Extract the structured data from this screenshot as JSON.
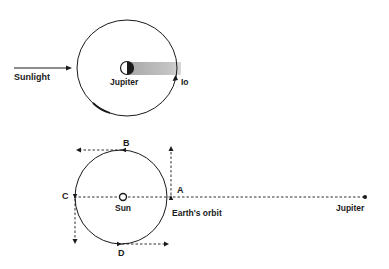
{
  "top_diagram": {
    "sunlight_label": "Sunlight",
    "jupiter_label": "Jupiter",
    "io_label": "Io"
  },
  "bottom_diagram": {
    "point_a": "A",
    "point_b": "B",
    "point_c": "C",
    "point_d": "D",
    "sun_label": "Sun",
    "orbit_label": "Earth's  orbit",
    "jupiter_label": "Jupiter"
  },
  "colors": {
    "line": "#1a1a1a",
    "shadow": "#bdbdbd",
    "background": "#ffffff"
  }
}
